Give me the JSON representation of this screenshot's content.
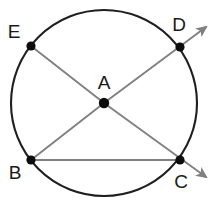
{
  "figure": {
    "canvas": {
      "width": 216,
      "height": 203,
      "background": "#ffffff"
    },
    "colors": {
      "circle_stroke": "#1f1f1f",
      "line_stroke": "#808080",
      "point_fill": "#0d0d0d",
      "label_fill": "#1a1a1a"
    },
    "circle": {
      "name": "circle-outline",
      "center_x": 104,
      "center_y": 103,
      "radius": 93,
      "stroke_width": 2.1
    },
    "points": [
      {
        "id": "A",
        "label": "A",
        "x": 104,
        "y": 103,
        "r": 5.2,
        "label_x": 104,
        "label_y": 84,
        "role": "center"
      },
      {
        "id": "B",
        "label": "B",
        "x": 31,
        "y": 160,
        "r": 4.6,
        "label_x": 15,
        "label_y": 174,
        "role": "on-circle"
      },
      {
        "id": "C",
        "label": "C",
        "x": 180,
        "y": 160,
        "r": 4.6,
        "label_x": 181,
        "label_y": 183,
        "role": "on-circle"
      },
      {
        "id": "D",
        "label": "D",
        "x": 180,
        "y": 47,
        "r": 4.6,
        "label_x": 179,
        "label_y": 26,
        "role": "on-circle"
      },
      {
        "id": "E",
        "label": "E",
        "x": 31,
        "y": 46,
        "r": 4.6,
        "label_x": 14,
        "label_y": 33,
        "role": "on-circle"
      }
    ],
    "segments": [
      {
        "name": "segment-E-to-A",
        "from": "E",
        "to": "A",
        "x1": 31,
        "y1": 46,
        "x2": 104,
        "y2": 103,
        "arrow": false
      },
      {
        "name": "ray-A-to-D",
        "from": "A",
        "to": "D",
        "x1": 104,
        "y1": 103,
        "x2": 206,
        "y2": 27,
        "arrow": true
      },
      {
        "name": "segment-B-to-A",
        "from": "B",
        "to": "A",
        "x1": 31,
        "y1": 160,
        "x2": 104,
        "y2": 103,
        "arrow": false
      },
      {
        "name": "ray-A-to-C",
        "from": "A",
        "to": "C",
        "x1": 104,
        "y1": 103,
        "x2": 206,
        "y2": 177,
        "arrow": true
      },
      {
        "name": "chord-B-to-C",
        "from": "B",
        "to": "C",
        "x1": 31,
        "y1": 160,
        "x2": 180,
        "y2": 160,
        "arrow": false
      }
    ],
    "stroke_widths": {
      "segment": 1.9,
      "chord": 1.9
    },
    "arrowheads": [
      {
        "name": "arrowhead-upper-right",
        "tip_x": 207,
        "tip_y": 26
      },
      {
        "name": "arrowhead-lower-right",
        "tip_x": 207,
        "tip_y": 178
      }
    ]
  }
}
